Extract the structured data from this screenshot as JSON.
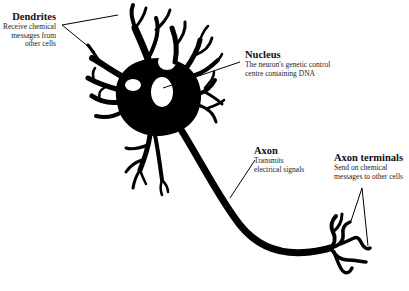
{
  "diagram": {
    "subject": "Neuron",
    "labels": {
      "dendrites": {
        "title": "Dendrites",
        "line1": "Receive chemical",
        "line2": "messages from",
        "line3": "other cells"
      },
      "nucleus": {
        "title": "Nucleus",
        "line1": "The neuron's genetic control",
        "line2": "centre containing DNA"
      },
      "axon": {
        "title": "Axon",
        "line1": "Transmits",
        "line2": "electrical signals"
      },
      "axon_terminals": {
        "title": "Axon terminals",
        "line1": "Send on chemical",
        "line2": "messages to other cells"
      }
    },
    "colors": {
      "ink": "#000000",
      "background": "#ffffff"
    }
  }
}
